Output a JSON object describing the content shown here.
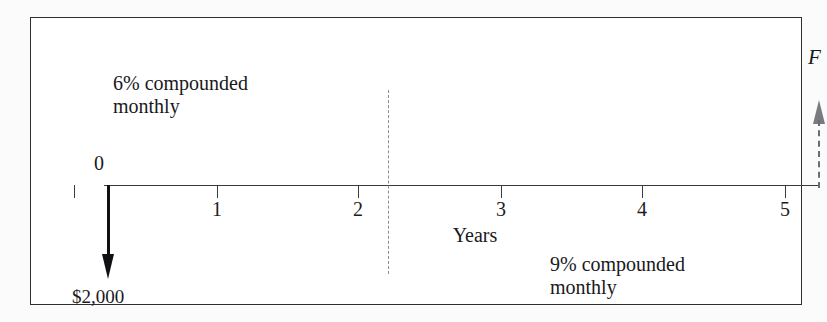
{
  "figure": {
    "type": "cash-flow-diagram",
    "axis_label": "Years",
    "background_color": "#ffffff",
    "border_color": "#2e2e33"
  },
  "timeline": {
    "ticks": [
      {
        "label": "0",
        "x": 73
      },
      {
        "label": "1",
        "x": 216
      },
      {
        "label": "2",
        "x": 357
      },
      {
        "label": "3",
        "x": 500
      },
      {
        "label": "4",
        "x": 641
      },
      {
        "label": "5",
        "x": 784
      }
    ]
  },
  "cash_flows": [
    {
      "name": "outflow",
      "label": "$2,000",
      "period": "0",
      "direction": "down",
      "style": "solid",
      "color": "#111114"
    },
    {
      "name": "inflow",
      "label": "F",
      "period": "5",
      "direction": "up",
      "style": "dashed",
      "color": "#7a7a80"
    }
  ],
  "annotations": {
    "left_rate": "6% compounded\nmonthly",
    "right_rate": "9% compounded\nmonthly",
    "divider_period": "2"
  },
  "chart_data": {
    "type": "line",
    "title": "",
    "xlabel": "Years",
    "ylabel": "",
    "x": [
      0,
      1,
      2,
      3,
      4,
      5
    ],
    "tick_labels": [
      "0",
      "1",
      "2",
      "3",
      "4",
      "5"
    ],
    "xlim": [
      0,
      5
    ],
    "grid": false,
    "legend": "none",
    "annotations": [
      {
        "text": "6% compounded monthly",
        "x_range": [
          0,
          2
        ]
      },
      {
        "text": "9% compounded monthly",
        "x_range": [
          2,
          5
        ]
      }
    ],
    "series": [
      {
        "name": "outflow",
        "x": 0,
        "value": -2000,
        "label": "$2,000",
        "direction": "down"
      },
      {
        "name": "inflow",
        "x": 5,
        "value": null,
        "label": "F",
        "direction": "up"
      }
    ]
  }
}
